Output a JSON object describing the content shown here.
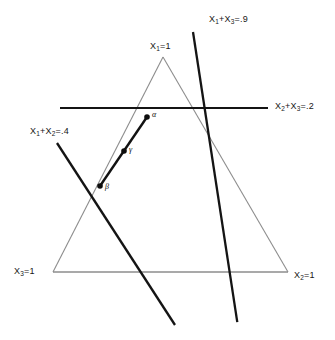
{
  "figure": {
    "type": "simplex-constraint-diagram",
    "background_color": "#ffffff",
    "line_color_thin": "#8a8a8a",
    "line_color_thick": "#111111",
    "simplex": {
      "name": "probability-simplex-triangle",
      "vertices": [
        {
          "label_prefix": "X",
          "label_sub": "1",
          "label_suffix": "=1",
          "text": "X1=1",
          "position": "top"
        },
        {
          "label_prefix": "X",
          "label_sub": "2",
          "label_suffix": "=1",
          "text": "X2=1",
          "position": "bottom-right"
        },
        {
          "label_prefix": "X",
          "label_sub": "3",
          "label_suffix": "=1",
          "text": "X3=1",
          "position": "bottom-left"
        }
      ]
    },
    "constraints": [
      {
        "id": "constraint-x1-x3",
        "prefix": "X",
        "sub1": "1",
        "mid": "+X",
        "sub2": "3",
        "suffix": "=.9",
        "text": "X1+X3=.9",
        "orientation": "diagonal-down-left"
      },
      {
        "id": "constraint-x2-x3",
        "prefix": "X",
        "sub1": "2",
        "mid": "+X",
        "sub2": "3",
        "suffix": "=.2",
        "text": "X2+X3=.2",
        "orientation": "horizontal"
      },
      {
        "id": "constraint-x1-x2",
        "prefix": "X",
        "sub1": "1",
        "mid": "+X",
        "sub2": "2",
        "suffix": "=.4",
        "text": "X1+X2=.4",
        "orientation": "diagonal-down-right"
      }
    ],
    "points": [
      {
        "id": "point-alpha",
        "label": "α",
        "role": "upper-endpoint"
      },
      {
        "id": "point-gamma",
        "label": "γ",
        "role": "midpoint"
      },
      {
        "id": "point-beta",
        "label": "β",
        "role": "lower-endpoint"
      }
    ],
    "segment": {
      "id": "solution-segment",
      "from": "β",
      "to": "α"
    }
  }
}
